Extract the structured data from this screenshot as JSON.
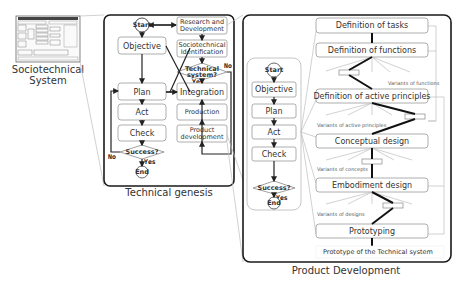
{
  "sociotechnical": {
    "caption_line1": "Sociotechnical",
    "caption_line2": "System"
  },
  "technical_genesis": {
    "caption": "Technical genesis",
    "pdca": {
      "start": "Start",
      "objective": "Objective",
      "plan": "Plan",
      "act": "Act",
      "check": "Check",
      "decision": "Success?",
      "yes": "Yes",
      "no": "No",
      "end": "End"
    },
    "right": {
      "research_line1": "Research and",
      "research_line2": "Development",
      "socio_line1": "Sociotechnical",
      "socio_line2": "Identification",
      "decision_line1": "Technical",
      "decision_line2": "system?",
      "yes": "Yes",
      "no": "No",
      "integration": "Integration",
      "production": "Production",
      "product_line1": "Product",
      "product_line2": "development"
    }
  },
  "product_development": {
    "caption": "Product Development",
    "pdca": {
      "start": "Start",
      "objective": "Objective",
      "plan": "Plan",
      "act": "Act",
      "check": "Check",
      "decision": "Success?",
      "yes": "Yes",
      "end": "End"
    },
    "stages": [
      "Definition of tasks",
      "Definition of functions",
      "Definition of active principles",
      "Conceptual design",
      "Embodiment design",
      "Prototyping"
    ],
    "variants": [
      "Variants of functions",
      "Variants of active principles",
      "Variants of concepts",
      "Variants of designs"
    ],
    "output": "Prototype of the Technical system"
  }
}
